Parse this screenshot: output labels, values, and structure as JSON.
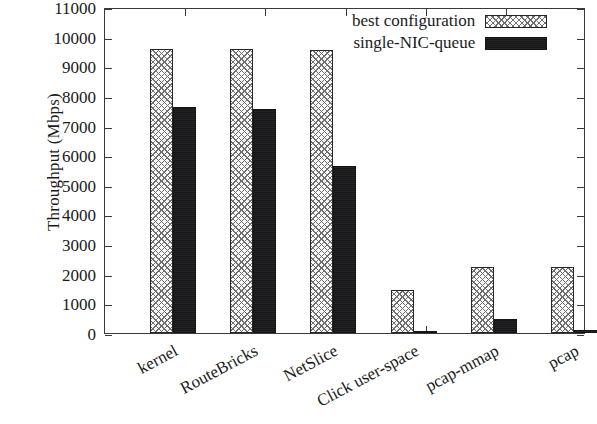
{
  "chart_data": {
    "type": "bar",
    "title": "",
    "xlabel": "",
    "ylabel": "Throughput (Mbps)",
    "ylim": [
      0,
      11000
    ],
    "yticks": [
      0,
      1000,
      2000,
      3000,
      4000,
      5000,
      6000,
      7000,
      8000,
      9000,
      10000,
      11000
    ],
    "ytick_labels": [
      "0",
      "1000",
      "2000",
      "3000",
      "4000",
      "5000",
      "6000",
      "7000",
      "8000",
      "9000",
      "10000",
      "11000"
    ],
    "grid": false,
    "legend_position": "top-right",
    "categories": [
      "kernel",
      "RouteBricks",
      "NetSlice",
      "Click user-space",
      "pcap-mmap",
      "pcap"
    ],
    "series": [
      {
        "name": "best configuration",
        "pattern": "cross-hatch",
        "color": "#fbfbfb",
        "values": [
          9600,
          9600,
          9550,
          1450,
          2230,
          2230
        ]
      },
      {
        "name": "single-NIC-queue",
        "pattern": "solid",
        "color": "#17171a",
        "values": [
          7620,
          7550,
          5640,
          60,
          480,
          100
        ]
      }
    ]
  },
  "axis": {
    "y_title": "Throughput (Mbps)"
  },
  "legend": {
    "entries": [
      {
        "label": "best configuration",
        "swatch": "hatched-swatch"
      },
      {
        "label": "single-NIC-queue",
        "swatch": "solid-swatch"
      }
    ]
  }
}
